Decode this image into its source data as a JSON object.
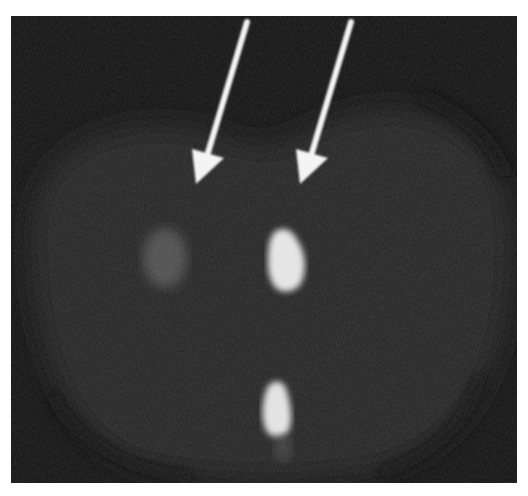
{
  "image": {
    "kind": "grayscale cross-sectional scan",
    "colors": {
      "page_background": "#ffffff",
      "outside_body": "#141414",
      "body_tissue": "#262626",
      "faint_lesion": "#4a4a4a",
      "bright_lesion": "#e6e6e6",
      "arrow": "#f4f4f4"
    },
    "annotations": [
      {
        "type": "arrow",
        "target": "faint-left-lesion",
        "tail": [
          247,
          22
        ],
        "tip": [
          196,
          183
        ]
      },
      {
        "type": "arrow",
        "target": "bright-center-lesion",
        "tail": [
          351,
          22
        ],
        "tip": [
          300,
          183
        ]
      }
    ],
    "findings": [
      {
        "name": "faint-left-lesion",
        "center": [
          165,
          258
        ],
        "size": [
          45,
          60
        ],
        "intensity": "low"
      },
      {
        "name": "bright-center-lesion",
        "center": [
          284,
          260
        ],
        "size": [
          38,
          62
        ],
        "intensity": "high"
      },
      {
        "name": "bright-lower-structure",
        "center": [
          276,
          409
        ],
        "size": [
          28,
          56
        ],
        "intensity": "high"
      }
    ]
  }
}
